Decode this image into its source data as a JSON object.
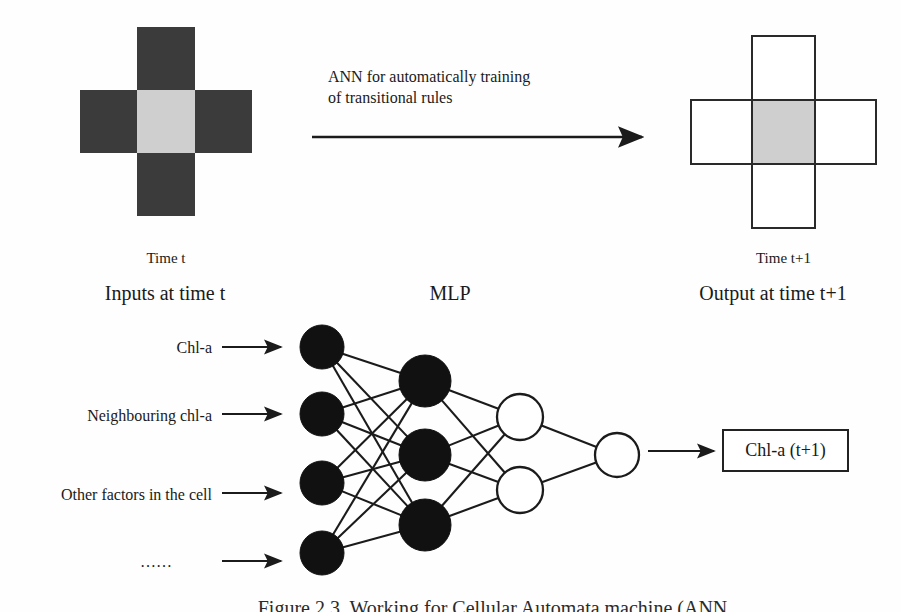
{
  "figure": {
    "caption": "Figure 2.3. Working for Cellular Automata machine (ANN...",
    "transition_text": "ANN for automatically training\nof transitional rules"
  },
  "neighbourhood_before": {
    "time_label": "Time t",
    "section_label": "Inputs at time t",
    "center_color": "#cfcfcf",
    "neighbour_color": "#3b3b3b",
    "cells": [
      {
        "role": "north",
        "state": "dark"
      },
      {
        "role": "west",
        "state": "dark"
      },
      {
        "role": "center",
        "state": "light"
      },
      {
        "role": "east",
        "state": "dark"
      },
      {
        "role": "south",
        "state": "dark"
      }
    ]
  },
  "neighbourhood_after": {
    "time_label": "Time t+1",
    "section_label": "Output at time t+1",
    "center_color": "#cfcfcf",
    "neighbour_color": "#ffffff",
    "cells": [
      {
        "role": "north",
        "state": "outline"
      },
      {
        "role": "west",
        "state": "outline"
      },
      {
        "role": "center",
        "state": "outline-gray"
      },
      {
        "role": "east",
        "state": "outline"
      },
      {
        "role": "south",
        "state": "outline"
      }
    ]
  },
  "mlp": {
    "title": "MLP",
    "input_labels": [
      "Chl-a",
      "Neighbouring chl-a",
      "Other factors in the cell",
      "……"
    ],
    "output_label": "Chl-a (t+1)",
    "layers": [
      {
        "name": "input",
        "count": 4,
        "style": "filled"
      },
      {
        "name": "hidden-1",
        "count": 3,
        "style": "filled"
      },
      {
        "name": "hidden-2",
        "count": 2,
        "style": "open"
      },
      {
        "name": "output",
        "count": 1,
        "style": "open"
      }
    ]
  },
  "colors": {
    "ink": "#1b1b1b",
    "filled_node": "#111111",
    "open_node": "#ffffff",
    "cell_dark": "#3b3b3b",
    "cell_light": "#cfcfcf",
    "background": "#ffffff"
  }
}
